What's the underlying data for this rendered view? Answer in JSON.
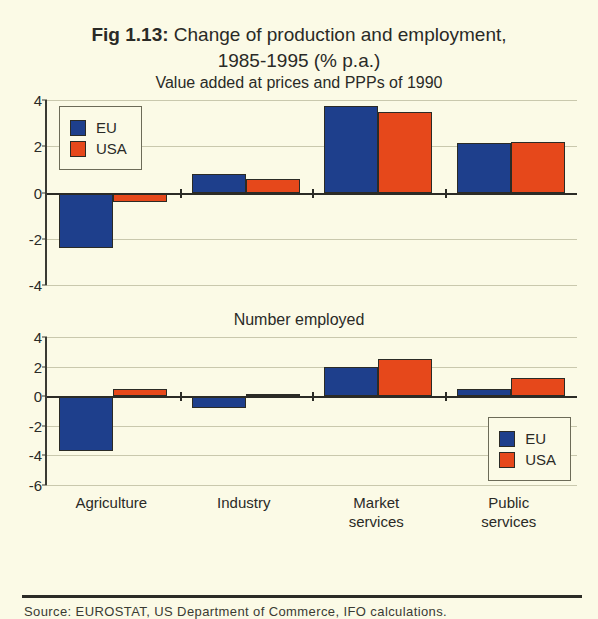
{
  "figure": {
    "number_label": "Fig 1.13:",
    "title_line1": "Change of production and employment,",
    "title_line2": "1985-1995 (% p.a.)"
  },
  "legend": {
    "eu_label": "EU",
    "usa_label": "USA",
    "eu_color": "#1e3f8c",
    "usa_color": "#e6481b"
  },
  "source": {
    "text": "Source: EUROSTAT, US Department of Commerce, IFO calculations."
  },
  "background_color": "#fbfae6",
  "chart_data": [
    {
      "type": "bar",
      "title": "Value added at prices and PPPs of 1990",
      "xlabel": "",
      "ylabel": "",
      "ylim": [
        -4,
        4
      ],
      "yticks": [
        4,
        2,
        0,
        -2,
        -4
      ],
      "ytick_labels": [
        "4",
        "2",
        "0",
        "-2",
        "-4"
      ],
      "grid": true,
      "legend_position": "top-left",
      "categories": [
        "Agriculture",
        "Industry",
        "Market\nservices",
        "Public services"
      ],
      "series": [
        {
          "name": "EU",
          "values": [
            -2.4,
            0.8,
            3.75,
            2.15
          ]
        },
        {
          "name": "USA",
          "values": [
            -0.4,
            0.6,
            3.5,
            2.2
          ]
        }
      ]
    },
    {
      "type": "bar",
      "title": "Number employed",
      "xlabel": "",
      "ylabel": "",
      "ylim": [
        -6,
        4
      ],
      "yticks": [
        4,
        2,
        0,
        -2,
        -4,
        -6
      ],
      "ytick_labels": [
        "4",
        "2",
        "0",
        "-2",
        "-4",
        "-6"
      ],
      "grid": true,
      "legend_position": "bottom-right",
      "categories": [
        "Agriculture",
        "Industry",
        "Market\nservices",
        "Public services"
      ],
      "series": [
        {
          "name": "EU",
          "values": [
            -3.7,
            -0.8,
            2.0,
            0.5
          ]
        },
        {
          "name": "USA",
          "values": [
            0.5,
            0.15,
            2.5,
            1.2
          ]
        }
      ]
    }
  ]
}
